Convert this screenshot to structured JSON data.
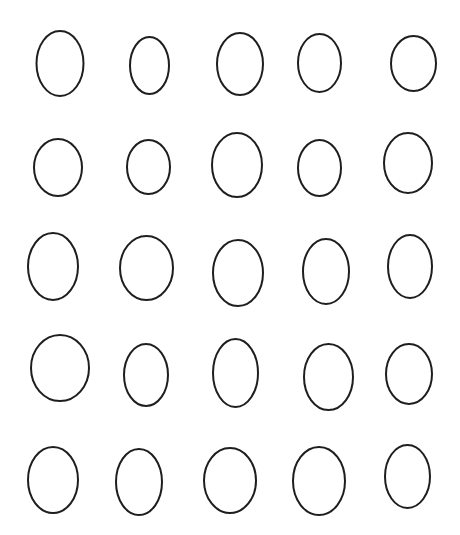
{
  "canvas": {
    "width": 460,
    "height": 535,
    "background": "#ffffff",
    "stroke": "#1e1e1e",
    "stroke_width": 2
  },
  "grid": {
    "rows": 5,
    "cols": 5
  },
  "ovals": [
    {
      "row": 1,
      "col": 1,
      "cx": 60,
      "cy": 63.5,
      "rx": 23.5,
      "ry": 32.5
    },
    {
      "row": 1,
      "col": 2,
      "cx": 149.5,
      "cy": 65.5,
      "rx": 19.5,
      "ry": 28.5
    },
    {
      "row": 1,
      "col": 3,
      "cx": 240,
      "cy": 64,
      "rx": 23,
      "ry": 31
    },
    {
      "row": 1,
      "col": 4,
      "cx": 319.5,
      "cy": 63,
      "rx": 21.5,
      "ry": 29
    },
    {
      "row": 1,
      "col": 5,
      "cx": 413.5,
      "cy": 63.5,
      "rx": 22.5,
      "ry": 27.5
    },
    {
      "row": 2,
      "col": 1,
      "cx": 58,
      "cy": 167.5,
      "rx": 24,
      "ry": 28.5
    },
    {
      "row": 2,
      "col": 2,
      "cx": 148.5,
      "cy": 167,
      "rx": 21.5,
      "ry": 27
    },
    {
      "row": 2,
      "col": 3,
      "cx": 237,
      "cy": 165,
      "rx": 25,
      "ry": 32
    },
    {
      "row": 2,
      "col": 4,
      "cx": 319.5,
      "cy": 168,
      "rx": 21.5,
      "ry": 28
    },
    {
      "row": 2,
      "col": 5,
      "cx": 408,
      "cy": 163,
      "rx": 24,
      "ry": 30
    },
    {
      "row": 3,
      "col": 1,
      "cx": 53,
      "cy": 266.5,
      "rx": 25,
      "ry": 33.5
    },
    {
      "row": 3,
      "col": 2,
      "cx": 146.5,
      "cy": 268,
      "rx": 26.5,
      "ry": 32
    },
    {
      "row": 3,
      "col": 3,
      "cx": 238,
      "cy": 273,
      "rx": 25,
      "ry": 33
    },
    {
      "row": 3,
      "col": 4,
      "cx": 326,
      "cy": 271.5,
      "rx": 23,
      "ry": 32.5
    },
    {
      "row": 3,
      "col": 5,
      "cx": 410,
      "cy": 266.5,
      "rx": 22,
      "ry": 31.5
    },
    {
      "row": 4,
      "col": 1,
      "cx": 60,
      "cy": 368,
      "rx": 29,
      "ry": 33
    },
    {
      "row": 4,
      "col": 2,
      "cx": 146,
      "cy": 375,
      "rx": 22,
      "ry": 31
    },
    {
      "row": 4,
      "col": 3,
      "cx": 235.5,
      "cy": 373,
      "rx": 22.5,
      "ry": 34
    },
    {
      "row": 4,
      "col": 4,
      "cx": 328.5,
      "cy": 377,
      "rx": 24.5,
      "ry": 33
    },
    {
      "row": 4,
      "col": 5,
      "cx": 409,
      "cy": 374,
      "rx": 23,
      "ry": 30
    },
    {
      "row": 5,
      "col": 1,
      "cx": 53,
      "cy": 480,
      "rx": 25,
      "ry": 33
    },
    {
      "row": 5,
      "col": 2,
      "cx": 139,
      "cy": 482,
      "rx": 23,
      "ry": 33
    },
    {
      "row": 5,
      "col": 3,
      "cx": 230,
      "cy": 480.5,
      "rx": 26,
      "ry": 32.5
    },
    {
      "row": 5,
      "col": 4,
      "cx": 319,
      "cy": 481,
      "rx": 26,
      "ry": 34
    },
    {
      "row": 5,
      "col": 5,
      "cx": 407.5,
      "cy": 476.5,
      "rx": 22.5,
      "ry": 31.5
    }
  ]
}
